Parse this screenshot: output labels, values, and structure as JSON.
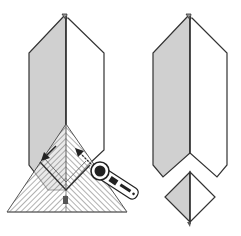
{
  "diagram": {
    "type": "quilting-instruction-illustration",
    "colors": {
      "background": "#ffffff",
      "outline": "#333333",
      "shaded_fabric": "#d0d0d0",
      "unshaded_fabric": "#ffffff",
      "ruler_hatch": "#555555",
      "cutter_body": "#222222"
    },
    "panels": [
      {
        "id": "before-cut",
        "description": "Folded strip with a triangular ruler placed at the bottom and a rotary cutter cutting along the ruler edges",
        "elements": [
          "folded-strip",
          "triangle-ruler",
          "rotary-cutter",
          "cut-direction-arrow-left",
          "cut-direction-arrow-right"
        ]
      },
      {
        "id": "after-cut",
        "description": "Strip with a V-notch cut at the bottom and the removed square-on-point piece below",
        "elements": [
          "notched-strip",
          "cut-off-square"
        ]
      }
    ]
  }
}
